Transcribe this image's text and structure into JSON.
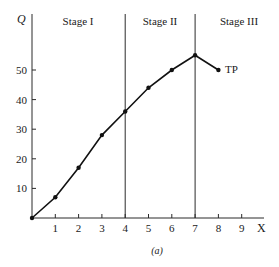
{
  "chart_data": {
    "type": "line",
    "title": "",
    "caption": "(a)",
    "xlabel": "X",
    "ylabel": "Q",
    "x": [
      0,
      1,
      2,
      3,
      4,
      5,
      6,
      7,
      8
    ],
    "series": [
      {
        "name": "TP",
        "values": [
          0,
          7,
          17,
          28,
          36,
          44,
          50,
          55,
          50
        ]
      }
    ],
    "xticks": [
      "1",
      "2",
      "3",
      "4",
      "5",
      "6",
      "7",
      "8",
      "9"
    ],
    "yticks": [
      "10",
      "20",
      "30",
      "40",
      "50"
    ],
    "xlim": [
      0,
      10
    ],
    "ylim": [
      0,
      60
    ],
    "grid": false,
    "vertical_lines": [
      4,
      7
    ],
    "regions": [
      {
        "label": "Stage I",
        "from": 0,
        "to": 4
      },
      {
        "label": "Stage II",
        "from": 4,
        "to": 7
      },
      {
        "label": "Stage III",
        "from": 7,
        "to": 10
      }
    ],
    "annotations": [
      {
        "text": "TP",
        "x": 8,
        "y": 50
      }
    ]
  },
  "labels": {
    "y_axis": "Q",
    "x_axis": "X",
    "stage1": "Stage I",
    "stage2": "Stage II",
    "stage3": "Stage III",
    "curve": "TP",
    "caption": "(a)"
  }
}
